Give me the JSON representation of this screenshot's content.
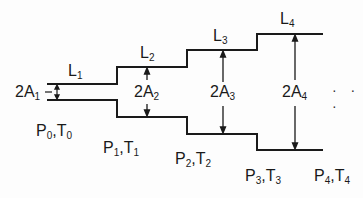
{
  "diagram": {
    "type": "stepped duct / expanding tube sections",
    "stroke_color": "#1a1a1a",
    "sections": [
      {
        "length_label": "L",
        "length_sub": "1",
        "area_label": "2A",
        "area_sub": "1",
        "x_start": 47,
        "x_end": 117,
        "y_top": 84,
        "y_bottom": 100
      },
      {
        "length_label": "L",
        "length_sub": "2",
        "area_label": "2A",
        "area_sub": "2",
        "x_start": 117,
        "x_end": 187,
        "y_top": 67,
        "y_bottom": 117
      },
      {
        "length_label": "L",
        "length_sub": "3",
        "area_label": "2A",
        "area_sub": "3",
        "x_start": 187,
        "x_end": 257,
        "y_top": 50,
        "y_bottom": 134
      },
      {
        "length_label": "L",
        "length_sub": "4",
        "area_label": "2A",
        "area_sub": "4",
        "x_start": 257,
        "x_end": 323,
        "y_top": 34,
        "y_bottom": 150
      }
    ],
    "states": [
      {
        "p": "P",
        "p_sub": "0",
        "t": "T",
        "t_sub": "0"
      },
      {
        "p": "P",
        "p_sub": "1",
        "t": "T",
        "t_sub": "1"
      },
      {
        "p": "P",
        "p_sub": "2",
        "t": "T",
        "t_sub": "2"
      },
      {
        "p": "P",
        "p_sub": "3",
        "t": "T",
        "t_sub": "3"
      },
      {
        "p": "P",
        "p_sub": "4",
        "t": "T",
        "t_sub": "4"
      }
    ],
    "continuation": "· · ·",
    "separator": ","
  }
}
